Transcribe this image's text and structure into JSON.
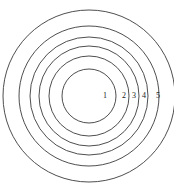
{
  "figure": {
    "type": "concentric-circles-diagram",
    "background_color": "#ffffff",
    "stroke_color": "#3a3a3a",
    "label_color": "#1a1a1a",
    "center": {
      "x": 89,
      "y": 96
    },
    "circle_count": 6,
    "circles": [
      {
        "index": 1,
        "radius": 27
      },
      {
        "index": 2,
        "radius": 40
      },
      {
        "index": 3,
        "radius": 50
      },
      {
        "index": 4,
        "radius": 59
      },
      {
        "index": 5,
        "radius": 70
      },
      {
        "index": 6,
        "radius": 86
      }
    ],
    "labels": [
      {
        "text": "1",
        "x": 105,
        "y": 96
      },
      {
        "text": "2",
        "x": 124,
        "y": 96
      },
      {
        "text": "3",
        "x": 134,
        "y": 96
      },
      {
        "text": "4",
        "x": 144,
        "y": 96
      },
      {
        "text": "5",
        "x": 158,
        "y": 96
      }
    ]
  }
}
